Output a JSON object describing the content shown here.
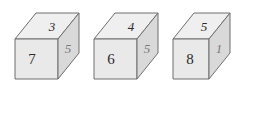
{
  "figure": {
    "caption": "",
    "cubes": [
      {
        "id": "cube-1",
        "top": "3",
        "front": "7",
        "right": "5"
      },
      {
        "id": "cube-2",
        "top": "4",
        "front": "6",
        "right": "5"
      },
      {
        "id": "cube-3",
        "top": "5",
        "front": "8",
        "right": "1"
      }
    ]
  },
  "answer": {
    "open_paren": "(",
    "close_paren": ")",
    "value": ""
  },
  "colors": {
    "front_face": "#e9e9e9",
    "top_face": "#efefef",
    "right_face": "#d9d9d9",
    "outline": "#6f6f6f",
    "digit": "#2b2b2b",
    "paren": "#4d4d4d",
    "background": "#ffffff"
  }
}
